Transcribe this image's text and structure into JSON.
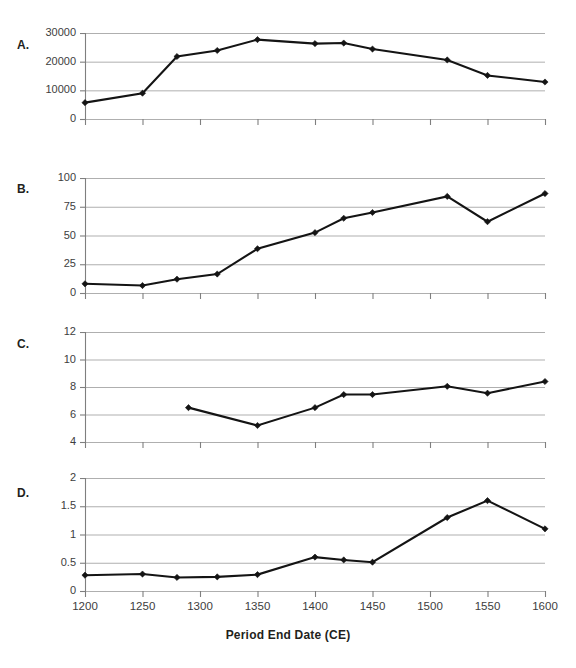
{
  "figure": {
    "width": 576,
    "height": 668,
    "background": "#ffffff",
    "line_color": "#141414",
    "grid_color": "#a6a6a6",
    "axis_color": "#7f7f7f",
    "xlabel": "Period End Date (CE)",
    "panel_labels": [
      "A.",
      "B.",
      "C.",
      "D."
    ]
  },
  "chart_data": [
    {
      "type": "line",
      "panel": "A.",
      "title": "",
      "xlabel": "Period End Date (CE)",
      "ylabel": "",
      "xlim": [
        1200,
        1600
      ],
      "ylim": [
        0,
        30000
      ],
      "xticks": [
        1200,
        1250,
        1300,
        1350,
        1400,
        1450,
        1500,
        1550,
        1600
      ],
      "xticklabels": [
        "1200",
        "1250",
        "1300",
        "1350",
        "1400",
        "1450",
        "1500",
        "1550",
        "1600"
      ],
      "yticks": [
        0,
        10000,
        20000,
        30000
      ],
      "yticklabels": [
        "0",
        "10000",
        "20000",
        "30000"
      ],
      "grid": true,
      "legend": "none",
      "x": [
        1200,
        1250,
        1280,
        1315,
        1350,
        1400,
        1425,
        1450,
        1515,
        1550,
        1600
      ],
      "values": [
        5700,
        9000,
        21800,
        23900,
        27700,
        26300,
        26500,
        24400,
        20600,
        15200,
        12900
      ]
    },
    {
      "type": "line",
      "panel": "B.",
      "title": "",
      "xlabel": "Period End Date (CE)",
      "ylabel": "",
      "xlim": [
        1200,
        1600
      ],
      "ylim": [
        0,
        100
      ],
      "xticks": [
        1200,
        1250,
        1300,
        1350,
        1400,
        1450,
        1500,
        1550,
        1600
      ],
      "xticklabels": [
        "1200",
        "1250",
        "1300",
        "1350",
        "1400",
        "1450",
        "1500",
        "1550",
        "1600"
      ],
      "yticks": [
        0,
        25,
        50,
        75,
        100
      ],
      "yticklabels": [
        "0",
        "25",
        "50",
        "75",
        "100"
      ],
      "grid": true,
      "legend": "none",
      "x": [
        1200,
        1250,
        1280,
        1315,
        1350,
        1400,
        1425,
        1450,
        1515,
        1550,
        1600
      ],
      "values": [
        8,
        6.5,
        12,
        16.5,
        38.5,
        52.5,
        65,
        70,
        84,
        62,
        86.5
      ]
    },
    {
      "type": "line",
      "panel": "C.",
      "title": "",
      "xlabel": "Period End Date (CE)",
      "ylabel": "",
      "xlim": [
        1200,
        1600
      ],
      "ylim": [
        4,
        12
      ],
      "xticks": [
        1200,
        1250,
        1300,
        1350,
        1400,
        1450,
        1500,
        1550,
        1600
      ],
      "xticklabels": [
        "1200",
        "1250",
        "1300",
        "1350",
        "1400",
        "1450",
        "1500",
        "1550",
        "1600"
      ],
      "yticks": [
        4,
        6,
        8,
        10,
        12
      ],
      "yticklabels": [
        "4",
        "6",
        "8",
        "10",
        "12"
      ],
      "grid": true,
      "legend": "none",
      "x": [
        1290,
        1350,
        1400,
        1425,
        1450,
        1515,
        1550,
        1600
      ],
      "values": [
        6.5,
        5.2,
        6.5,
        7.45,
        7.45,
        8.05,
        7.55,
        8.4
      ]
    },
    {
      "type": "line",
      "panel": "D.",
      "title": "",
      "xlabel": "Period End Date (CE)",
      "ylabel": "",
      "xlim": [
        1200,
        1600
      ],
      "ylim": [
        0,
        2
      ],
      "xticks": [
        1200,
        1250,
        1300,
        1350,
        1400,
        1450,
        1500,
        1550,
        1600
      ],
      "xticklabels": [
        "1200",
        "1250",
        "1300",
        "1350",
        "1400",
        "1450",
        "1500",
        "1550",
        "1600"
      ],
      "yticks": [
        0,
        0.5,
        1,
        1.5,
        2
      ],
      "yticklabels": [
        "0",
        "0.5",
        "1",
        "1.5",
        "2"
      ],
      "grid": true,
      "legend": "none",
      "x": [
        1200,
        1250,
        1280,
        1315,
        1350,
        1400,
        1425,
        1450,
        1515,
        1550,
        1600
      ],
      "values": [
        0.28,
        0.3,
        0.24,
        0.25,
        0.29,
        0.6,
        0.55,
        0.51,
        1.3,
        1.6,
        1.1
      ]
    }
  ]
}
